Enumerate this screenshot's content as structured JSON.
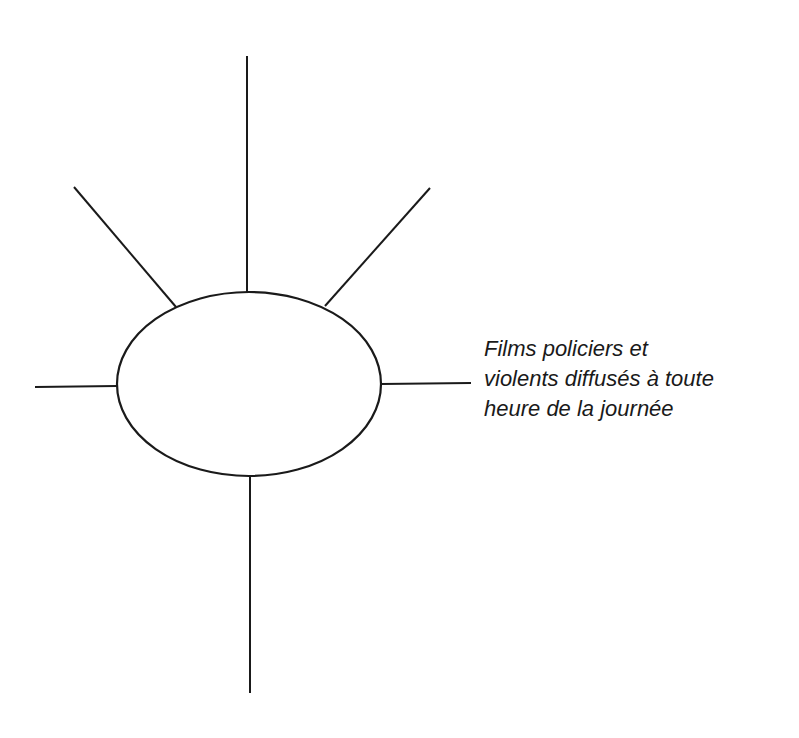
{
  "diagram": {
    "type": "spider-map",
    "hub": {
      "cx": 249,
      "cy": 384,
      "rx": 132,
      "ry": 92,
      "label": ""
    },
    "spokes": [
      {
        "id": "top",
        "x1": 247,
        "y1": 56,
        "x2": 247,
        "y2": 292,
        "label": ""
      },
      {
        "id": "upper-left",
        "x1": 74,
        "y1": 187,
        "x2": 176,
        "y2": 307,
        "label": ""
      },
      {
        "id": "upper-right",
        "x1": 430,
        "y1": 188,
        "x2": 325,
        "y2": 306,
        "label": ""
      },
      {
        "id": "left",
        "x1": 35,
        "y1": 387,
        "x2": 117,
        "y2": 386,
        "label": ""
      },
      {
        "id": "right",
        "x1": 381,
        "y1": 384,
        "x2": 471,
        "y2": 383,
        "label": "Films policiers et violents diffusés à toute heure de la journée"
      },
      {
        "id": "bottom",
        "x1": 250,
        "y1": 477,
        "x2": 250,
        "y2": 693,
        "label": ""
      }
    ],
    "right_label_lines": [
      "Films policiers et",
      "violents diffusés à toute",
      "heure de la journée"
    ],
    "colors": {
      "stroke": "#1a1a1a",
      "background": "#ffffff",
      "text": "#1a1a1a"
    }
  }
}
